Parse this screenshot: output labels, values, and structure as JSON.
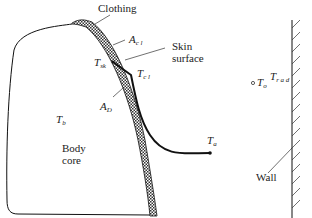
{
  "diagram": {
    "labels": {
      "clothing": "Clothing",
      "skin_surface_line1": "Skin",
      "skin_surface_line2": "surface",
      "body_core_line1": "Body",
      "body_core_line2": "core",
      "wall": "Wall"
    },
    "symbols": {
      "a_cl": {
        "main": "A",
        "sub": "c l"
      },
      "t_sk": {
        "main": "T",
        "sub": "sk"
      },
      "t_cl": {
        "main": "T",
        "sub": "c l"
      },
      "a_d": {
        "main": "A",
        "sub": "D"
      },
      "t_b": {
        "main": "T",
        "sub": "b"
      },
      "t_a": {
        "main": "T",
        "sub": "a"
      },
      "t_o": {
        "main": "T",
        "sub": "o"
      },
      "t_rad": {
        "main": "T",
        "sub": "r a d"
      }
    },
    "colors": {
      "line": "#111111",
      "clothing_fill": "#888888",
      "background": "#ffffff"
    }
  }
}
